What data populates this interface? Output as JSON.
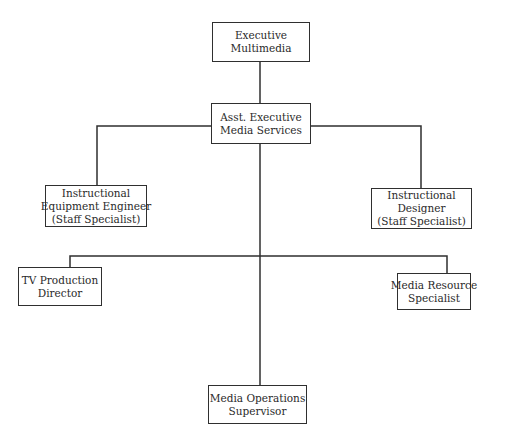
{
  "chart": {
    "type": "org-chart",
    "nodes": [
      {
        "id": "executive",
        "lines": [
          "Executive",
          "Multimedia"
        ]
      },
      {
        "id": "asst_executive",
        "lines": [
          "Asst. Executive",
          "Media Services"
        ]
      },
      {
        "id": "equipment_engineer",
        "lines": [
          "Instructional",
          "Equipment Engineer",
          "(Staff Specialist)"
        ]
      },
      {
        "id": "instructional_designer",
        "lines": [
          "Instructional",
          "Designer",
          "(Staff Specialist)"
        ]
      },
      {
        "id": "tv_director",
        "lines": [
          "TV Production",
          "Director"
        ]
      },
      {
        "id": "media_resource",
        "lines": [
          "Media Resource",
          "Specialist"
        ]
      },
      {
        "id": "media_operations",
        "lines": [
          "Media Operations",
          "Supervisor"
        ]
      }
    ],
    "edges": [
      [
        "executive",
        "asst_executive"
      ],
      [
        "asst_executive",
        "equipment_engineer"
      ],
      [
        "asst_executive",
        "instructional_designer"
      ],
      [
        "asst_executive",
        "tv_director"
      ],
      [
        "asst_executive",
        "media_resource"
      ],
      [
        "asst_executive",
        "media_operations"
      ]
    ]
  },
  "colors": {
    "line": "#2f2f2f",
    "text": "#2a2a2a",
    "background": "#ffffff"
  }
}
